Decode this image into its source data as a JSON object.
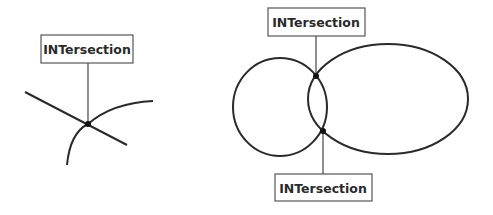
{
  "diagrams": [
    {
      "name": "line-curve-intersection",
      "labels": [
        {
          "text": "INTersection"
        }
      ]
    },
    {
      "name": "circle-ellipse-intersection",
      "labels": [
        {
          "text": "INTersection"
        },
        {
          "text": "INTersection"
        }
      ]
    }
  ],
  "colors": {
    "stroke": "#2a2a2a",
    "box_border": "#555555",
    "dot": "#111111",
    "background": "#ffffff"
  }
}
